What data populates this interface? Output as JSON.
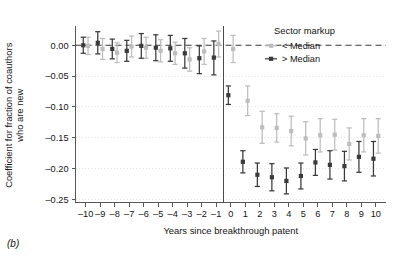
{
  "panel": {
    "label": "(b)"
  },
  "chart_data": {
    "type": "scatter",
    "title": "",
    "xlabel": "Years since breakthrough patent",
    "ylabel": "Coefficient for fraction of coauthors who are new",
    "ylabel_line1": "Coefficient for fraction of coauthors",
    "ylabel_line2": "who are new",
    "x": [
      -10,
      -9,
      -8,
      -7,
      -6,
      -5,
      -4,
      -3,
      -2,
      -1,
      0,
      1,
      2,
      3,
      4,
      5,
      6,
      7,
      8,
      9,
      10
    ],
    "xtick_labels": [
      "–10",
      "–9",
      "–8",
      "–7",
      "–6",
      "–5",
      "–4",
      "–3",
      "–2",
      "–1",
      "0",
      "1",
      "2",
      "3",
      "4",
      "5",
      "6",
      "7",
      "8",
      "9",
      "10"
    ],
    "ytick_values": [
      0.0,
      -0.05,
      -0.1,
      -0.15,
      -0.2,
      -0.25
    ],
    "ytick_labels": [
      "0.00",
      "–0.05",
      "–0.10",
      "–0.15",
      "–0.20",
      "–0.25"
    ],
    "xlim": [
      -10.7,
      10.7
    ],
    "ylim": [
      -0.255,
      0.028
    ],
    "grid": true,
    "reference_lines": {
      "horizontal_zero": 0.0,
      "vertical_event": -0.5
    },
    "legend": {
      "title": "Sector markup",
      "position": "top-right",
      "entries": [
        {
          "name": "< Median",
          "color": "#bdbdbd",
          "marker": "plus-dot"
        },
        {
          "name": "> Median",
          "color": "#3a3a3a",
          "marker": "square-dot"
        }
      ]
    },
    "series": [
      {
        "name": "< Median",
        "color": "#bdbdbd",
        "values": [
          -0.001,
          -0.006,
          -0.012,
          -0.002,
          -0.004,
          -0.009,
          -0.013,
          -0.023,
          -0.01,
          0.002,
          -0.006,
          -0.09,
          -0.133,
          -0.134,
          -0.139,
          -0.151,
          -0.146,
          -0.145,
          -0.16,
          -0.146,
          -0.147
        ],
        "ci_lower": [
          -0.015,
          -0.023,
          -0.028,
          -0.019,
          -0.021,
          -0.027,
          -0.031,
          -0.042,
          -0.031,
          -0.019,
          -0.028,
          -0.114,
          -0.159,
          -0.157,
          -0.163,
          -0.178,
          -0.173,
          -0.17,
          -0.186,
          -0.173,
          -0.175
        ],
        "ci_upper": [
          0.013,
          0.011,
          0.004,
          0.015,
          0.013,
          0.009,
          0.005,
          -0.004,
          0.011,
          0.023,
          0.016,
          -0.066,
          -0.107,
          -0.111,
          -0.115,
          -0.124,
          -0.119,
          -0.12,
          -0.134,
          -0.119,
          -0.119
        ]
      },
      {
        "name": "> Median",
        "color": "#3a3a3a",
        "values": [
          0.0,
          0.004,
          -0.006,
          -0.009,
          -0.001,
          -0.004,
          -0.005,
          -0.013,
          -0.021,
          -0.02,
          -0.081,
          -0.189,
          -0.21,
          -0.214,
          -0.22,
          -0.212,
          -0.19,
          -0.194,
          -0.196,
          -0.181,
          -0.184
        ],
        "ci_lower": [
          -0.013,
          -0.014,
          -0.022,
          -0.026,
          -0.021,
          -0.025,
          -0.026,
          -0.037,
          -0.046,
          -0.048,
          -0.096,
          -0.207,
          -0.229,
          -0.236,
          -0.241,
          -0.233,
          -0.211,
          -0.217,
          -0.22,
          -0.206,
          -0.212
        ],
        "ci_upper": [
          0.013,
          0.022,
          0.01,
          0.008,
          0.019,
          0.017,
          0.016,
          0.011,
          -0.001,
          0.007,
          -0.066,
          -0.171,
          -0.191,
          -0.192,
          -0.199,
          -0.191,
          -0.169,
          -0.171,
          -0.172,
          -0.156,
          -0.156
        ]
      }
    ]
  }
}
